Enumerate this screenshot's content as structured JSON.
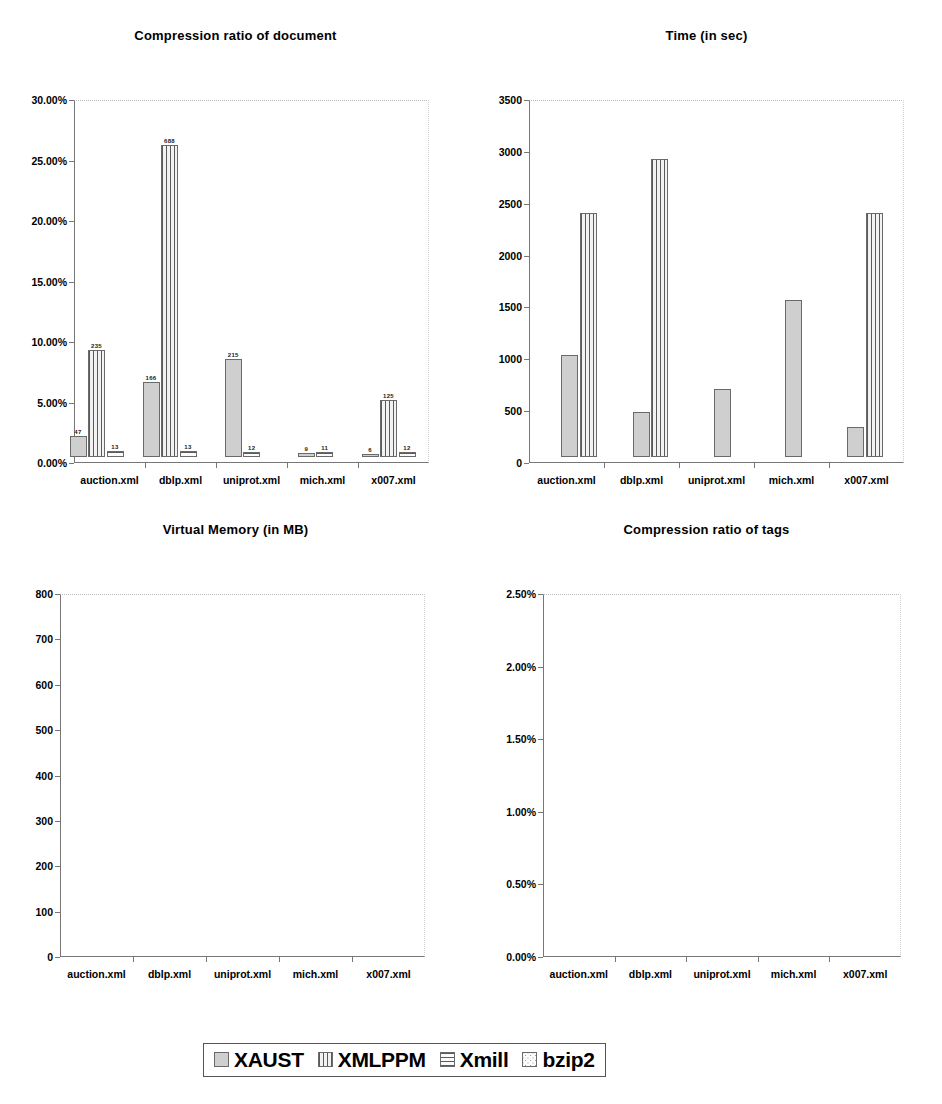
{
  "legend": {
    "items": [
      {
        "label": "XAUST",
        "pattern": "solid-gray"
      },
      {
        "label": "XMLPPM",
        "pattern": "vertical-lines"
      },
      {
        "label": "Xmill",
        "pattern": "horizontal-lines"
      },
      {
        "label": "bzip2",
        "pattern": "dotted"
      }
    ]
  },
  "series_names": [
    "XAUST",
    "XMLPPM",
    "Xmill",
    "bzip2"
  ],
  "categories": [
    "auction.xml",
    "dblp.xml",
    "uniprot.xml",
    "mich.xml",
    "x007.xml"
  ],
  "chart_data": [
    {
      "type": "bar",
      "title": "Compression ratio of document",
      "xlabel": "",
      "ylabel": "",
      "ylim": [
        0,
        30
      ],
      "yticks": [
        "0.00%",
        "5.00%",
        "10.00%",
        "15.00%",
        "20.00%",
        "25.00%",
        "30.00%"
      ],
      "ytick_values": [
        0,
        5,
        10,
        15,
        20,
        25,
        30
      ],
      "grid": false,
      "legend_position": "bottom-shared",
      "categories": [
        "auction.xml",
        "dblp.xml",
        "uniprot.xml",
        "mich.xml",
        "x007.xml"
      ],
      "value_labels": false,
      "series": [
        {
          "name": "XAUST",
          "values": [
            17.3,
            9.8,
            7.5,
            7.0,
            5.3
          ]
        },
        {
          "name": "XMLPPM",
          "values": [
            16.0,
            9.9,
            null,
            null,
            6.8
          ]
        },
        {
          "name": "Xmill",
          "values": [
            28.5,
            14.5,
            7.2,
            11.7,
            6.1
          ]
        },
        {
          "name": "bzip2",
          "values": [
            21.6,
            11.3,
            8.4,
            6.4,
            3.3
          ]
        }
      ]
    },
    {
      "type": "bar",
      "title": "Time (in sec)",
      "xlabel": "",
      "ylabel": "",
      "ylim": [
        0,
        3500
      ],
      "yticks": [
        "0",
        "500",
        "1000",
        "1500",
        "2000",
        "2500",
        "3000",
        "3500"
      ],
      "ytick_values": [
        0,
        500,
        1000,
        1500,
        2000,
        2500,
        3000,
        3500
      ],
      "grid": false,
      "legend_position": "bottom-shared",
      "categories": [
        "auction.xml",
        "dblp.xml",
        "uniprot.xml",
        "mich.xml",
        "x007.xml"
      ],
      "value_labels": true,
      "series": [
        {
          "name": "XAUST",
          "values": [
            207,
            432,
            1782,
            675,
            174
          ]
        },
        {
          "name": "XMLPPM",
          "values": [
            816,
            2990,
            null,
            null,
            174
          ]
        },
        {
          "name": "Xmill",
          "values": [
            16,
            21,
            73,
            47,
            8
          ]
        },
        {
          "name": "bzip2",
          "values": [
            null,
            null,
            null,
            null,
            null
          ]
        }
      ]
    },
    {
      "type": "bar",
      "title": "Virtual Memory (in MB)",
      "xlabel": "",
      "ylabel": "",
      "ylim": [
        0,
        800
      ],
      "yticks": [
        "0",
        "100",
        "200",
        "300",
        "400",
        "500",
        "600",
        "700",
        "800"
      ],
      "ytick_values": [
        0,
        100,
        200,
        300,
        400,
        500,
        600,
        700,
        800
      ],
      "grid": false,
      "legend_position": "bottom-shared",
      "categories": [
        "auction.xml",
        "dblp.xml",
        "uniprot.xml",
        "mich.xml",
        "x007.xml"
      ],
      "value_labels": true,
      "series": [
        {
          "name": "XAUST",
          "values": [
            47,
            166,
            215,
            9,
            6
          ]
        },
        {
          "name": "XMLPPM",
          "values": [
            235,
            688,
            null,
            null,
            125
          ]
        },
        {
          "name": "Xmill",
          "values": [
            13,
            13,
            12,
            11,
            12
          ]
        },
        {
          "name": "bzip2",
          "values": [
            null,
            null,
            null,
            null,
            null
          ]
        }
      ]
    },
    {
      "type": "bar",
      "title": "Compression ratio of tags",
      "xlabel": "",
      "ylabel": "",
      "ylim": [
        0,
        2.5
      ],
      "yticks": [
        "0.00%",
        "0.50%",
        "1.00%",
        "1.50%",
        "2.00%",
        "2.50%"
      ],
      "ytick_values": [
        0,
        0.5,
        1.0,
        1.5,
        2.0,
        2.5
      ],
      "grid": false,
      "legend_position": "bottom-shared",
      "categories": [
        "auction.xml",
        "dblp.xml",
        "uniprot.xml",
        "mich.xml",
        "x007.xml"
      ],
      "value_labels": false,
      "series": [
        {
          "name": "XAUST",
          "values": [
            0.7,
            0.31,
            0.47,
            1.08,
            0.21
          ]
        },
        {
          "name": "XMLPPM",
          "values": [
            1.68,
            2.05,
            null,
            null,
            1.68
          ]
        },
        {
          "name": "Xmill",
          "values": [
            null,
            null,
            null,
            null,
            null
          ]
        },
        {
          "name": "bzip2",
          "values": [
            null,
            null,
            null,
            null,
            null
          ]
        }
      ]
    }
  ]
}
